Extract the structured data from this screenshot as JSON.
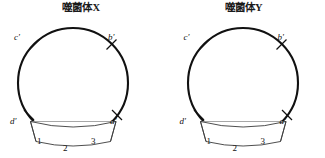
{
  "figure": {
    "background_color": "#ffffff",
    "stroke_color": "#111111",
    "panels": [
      {
        "id": "phage-x",
        "title": "噬菌体X",
        "genome": {
          "shape": "circle",
          "sites": [
            {
              "key": "c",
              "label": "c'",
              "angle_deg": 135
            },
            {
              "key": "b",
              "label": "b'",
              "angle_deg": 45
            },
            {
              "key": "d",
              "label": "d'",
              "angle_deg": 215
            },
            {
              "key": "a",
              "label": "a'",
              "angle_deg": 325
            }
          ]
        },
        "band": {
          "shape": "curved-segment",
          "segments": [
            {
              "label": "1"
            },
            {
              "label": "2"
            },
            {
              "label": "3"
            }
          ]
        }
      },
      {
        "id": "phage-y",
        "title": "噬菌体Y",
        "genome": {
          "shape": "circle",
          "sites": [
            {
              "key": "c",
              "label": "c'",
              "angle_deg": 135
            },
            {
              "key": "b",
              "label": "b'",
              "angle_deg": 45
            },
            {
              "key": "d",
              "label": "d'",
              "angle_deg": 215
            },
            {
              "key": "a",
              "label": "a'",
              "angle_deg": 325
            }
          ]
        },
        "band": {
          "shape": "curved-segment",
          "segments": [
            {
              "label": "1"
            },
            {
              "label": "2"
            },
            {
              "label": "3"
            }
          ]
        }
      }
    ]
  }
}
